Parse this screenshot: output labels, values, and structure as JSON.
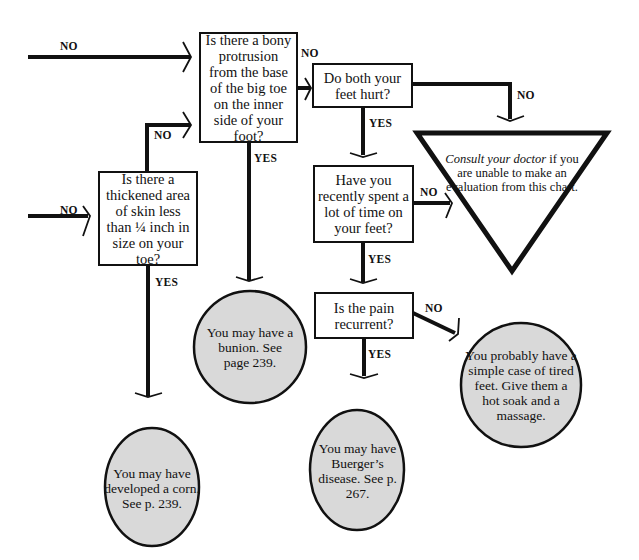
{
  "questions": {
    "bony_protrusion": "Is there a bony protrusion from the base of the big toe on the inner side of your foot?",
    "both_feet": "Do both your feet hurt?",
    "thickened_skin": "Is there a thickened area of skin less than ¼ inch in size on your toe?",
    "time_on_feet": "Have you recently spent a lot of time on your feet?",
    "pain_recurrent": "Is the pain recurrent?"
  },
  "outcomes": {
    "bunion": "You may have a bunion. See page 239.",
    "corn": "You may have developed a corn. See p. 239.",
    "buerger": "You may have Buerger’s disease. See p. 267.",
    "tired_feet": "You probably have a simple case of tired feet. Give them a hot soak and a massage."
  },
  "consult": {
    "italic": "Consult your doctor",
    "rest": " if you are unable to make an evaluation from this chart."
  },
  "labels": {
    "yes": "YES",
    "no": "NO"
  },
  "colors": {
    "line": "#111111",
    "outcome_fill": "#d9d9d9",
    "background": "#ffffff"
  }
}
